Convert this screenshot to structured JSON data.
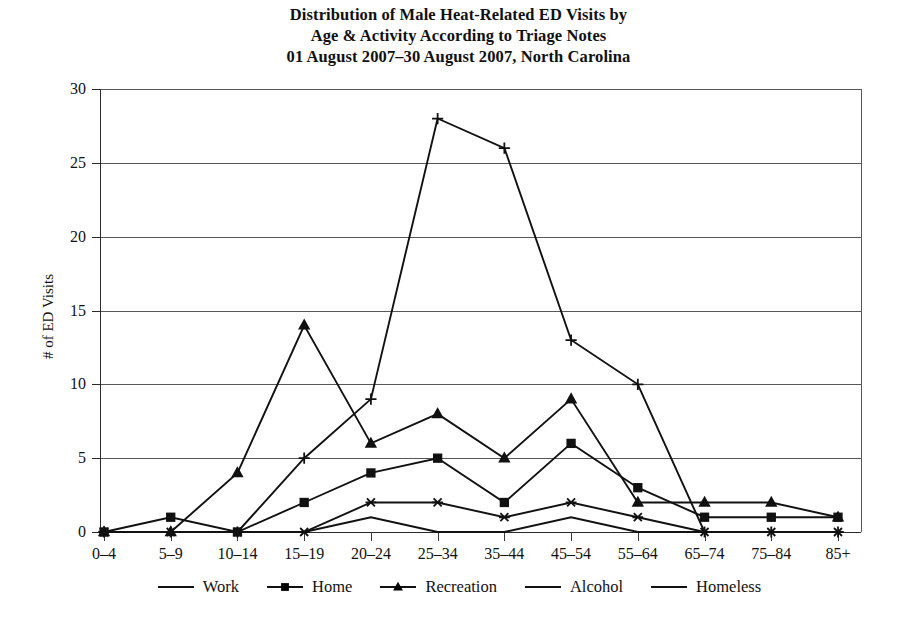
{
  "chart_data": {
    "type": "line",
    "title": "Distribution of Male Heat-Related ED Visits by Age & Activity According to Triage Notes 01 August 2007–30 August 2007, North Carolina",
    "title_lines": [
      "Distribution of Male Heat-Related ED Visits by",
      "Age & Activity According to Triage Notes",
      "01 August 2007–30 August 2007, North Carolina"
    ],
    "xlabel": "",
    "ylabel": "# of ED Visits",
    "categories": [
      "0–4",
      "5–9",
      "10–14",
      "15–19",
      "20–24",
      "25–34",
      "35–44",
      "45–54",
      "55–64",
      "65–74",
      "75–84",
      "85+"
    ],
    "ylim": [
      0,
      30
    ],
    "yticks": [
      0,
      5,
      10,
      15,
      20,
      25,
      30
    ],
    "ytick_labels": [
      "0",
      "5",
      "10",
      "15",
      "20",
      "25",
      "30"
    ],
    "grid": true,
    "legend_position": "bottom",
    "series": [
      {
        "name": "Work",
        "marker": "plus",
        "values": [
          0,
          0,
          0,
          5,
          9,
          28,
          26,
          13,
          10,
          0,
          0,
          0
        ]
      },
      {
        "name": "Home",
        "marker": "square",
        "values": [
          0,
          1,
          0,
          2,
          4,
          5,
          2,
          6,
          3,
          1,
          1,
          1
        ]
      },
      {
        "name": "Recreation",
        "marker": "triangle",
        "values": [
          0,
          0,
          4,
          14,
          6,
          8,
          5,
          9,
          2,
          2,
          2,
          1
        ]
      },
      {
        "name": "Alcohol",
        "marker": "asterisk",
        "values": [
          0,
          0,
          0,
          0,
          2,
          2,
          1,
          2,
          1,
          0,
          0,
          0
        ]
      },
      {
        "name": "Homeless",
        "marker": "none",
        "values": [
          0,
          0,
          0,
          0,
          1,
          0,
          0,
          1,
          0,
          0,
          0,
          0
        ]
      }
    ],
    "line_color": "#111111",
    "grid_color": "#585858",
    "axis_color": "#2b2b2b",
    "background": "#ffffff"
  }
}
